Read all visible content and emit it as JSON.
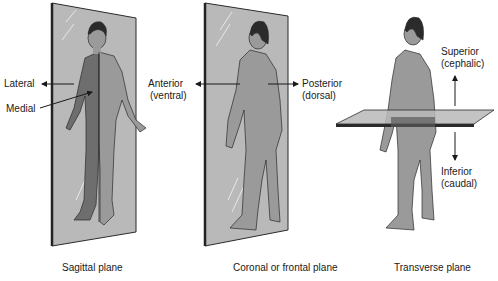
{
  "figure": {
    "panels": [
      {
        "id": "sagittal",
        "caption": "Sagittal plane",
        "labels": {
          "lateral": "Lateral",
          "medial": "Medial"
        }
      },
      {
        "id": "coronal",
        "caption": "Coronal or frontal plane",
        "labels": {
          "anterior_line1": "Anterior",
          "anterior_line2": "(ventral)",
          "posterior_line1": "Posterior",
          "posterior_line2": "(dorsal)"
        }
      },
      {
        "id": "transverse",
        "caption": "Transverse plane",
        "labels": {
          "superior_line1": "Superior",
          "superior_line2": "(cephalic)",
          "inferior_line1": "Inferior",
          "inferior_line2": "(caudal)"
        }
      }
    ],
    "colors": {
      "plane_fill": "#b9b9b9",
      "plane_edge": "#2a2a2a",
      "body_light": "#9a9a9a",
      "body_dark": "#6e6e6e",
      "hair": "#2b2b2b",
      "text": "#1a1a1a"
    }
  }
}
